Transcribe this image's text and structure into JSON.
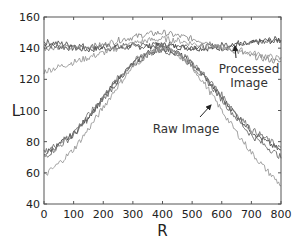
{
  "chart_data": {
    "type": "line",
    "title": "",
    "xlabel": "R",
    "ylabel": "L",
    "xlim": [
      0,
      800
    ],
    "ylim": [
      40,
      160
    ],
    "xticks": [
      0,
      100,
      200,
      300,
      400,
      500,
      600,
      700,
      800
    ],
    "yticks": [
      40,
      60,
      80,
      100,
      120,
      140,
      160
    ],
    "grid": false,
    "legend": null,
    "annotations": [
      {
        "text_lines": [
          "Processed",
          "Image"
        ],
        "arrow_to": [
          645,
          142
        ],
        "text_at": [
          640,
          120
        ]
      },
      {
        "text_lines": [
          "Raw Image"
        ],
        "arrow_to": [
          595,
          111
        ],
        "text_at": [
          430,
          100
        ]
      }
    ],
    "x": [
      0,
      50,
      100,
      150,
      200,
      250,
      300,
      350,
      400,
      450,
      500,
      550,
      600,
      650,
      700,
      750,
      800
    ],
    "series": [
      {
        "name": "Processed Image 1",
        "group": "processed",
        "color": "#444444",
        "values": [
          142,
          141,
          140,
          139,
          140,
          140,
          141,
          141,
          142,
          141,
          140,
          140,
          140,
          142,
          143,
          145,
          146
        ]
      },
      {
        "name": "Processed Image 2",
        "group": "processed",
        "color": "#555555",
        "values": [
          144,
          143,
          142,
          141,
          141,
          141,
          142,
          142,
          142,
          142,
          141,
          141,
          142,
          143,
          144,
          144,
          145
        ]
      },
      {
        "name": "Processed Image 3",
        "group": "processed",
        "color": "#888888",
        "values": [
          140,
          141,
          140,
          141,
          142,
          145,
          147,
          149,
          150,
          148,
          146,
          144,
          141,
          138,
          135,
          133,
          131
        ]
      },
      {
        "name": "Processed Image 4",
        "group": "processed",
        "color": "#999999",
        "values": [
          125,
          128,
          131,
          134,
          137,
          140,
          143,
          145,
          146,
          145,
          143,
          141,
          140,
          139,
          137,
          135,
          133
        ]
      },
      {
        "name": "Raw Image 1",
        "group": "raw",
        "color": "#444444",
        "values": [
          72,
          78,
          85,
          96,
          108,
          120,
          130,
          137,
          140,
          137,
          130,
          120,
          108,
          97,
          87,
          80,
          74
        ]
      },
      {
        "name": "Raw Image 2",
        "group": "raw",
        "color": "#666666",
        "values": [
          70,
          77,
          84,
          95,
          107,
          119,
          129,
          136,
          139,
          136,
          129,
          119,
          107,
          95,
          84,
          77,
          70
        ]
      },
      {
        "name": "Raw Image 3",
        "group": "raw",
        "color": "#777777",
        "values": [
          73,
          79,
          86,
          97,
          109,
          121,
          131,
          138,
          141,
          138,
          131,
          121,
          110,
          98,
          88,
          82,
          76
        ]
      },
      {
        "name": "Raw Image 4",
        "group": "raw",
        "color": "#999999",
        "values": [
          58,
          66,
          75,
          88,
          102,
          116,
          128,
          136,
          140,
          136,
          128,
          115,
          100,
          86,
          73,
          62,
          52
        ]
      }
    ]
  },
  "plot_style": {
    "axis_color": "#555555",
    "background": "#ffffff"
  }
}
